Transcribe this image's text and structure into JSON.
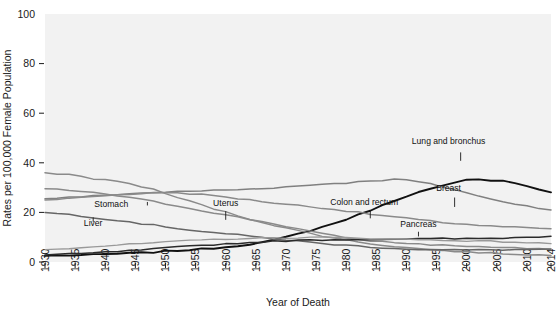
{
  "chart_data": {
    "type": "line",
    "title": "",
    "xlabel": "Year of Death",
    "ylabel": "Rates per 100,000 Female Population",
    "xlim": [
      1930,
      2014
    ],
    "ylim": [
      0,
      100
    ],
    "grid": false,
    "legend_position": "inline-annotations",
    "x_ticks": [
      "1930",
      "1935",
      "1940",
      "1945",
      "1950",
      "1955",
      "1960",
      "1965",
      "1970",
      "1975",
      "1980",
      "1985",
      "1990",
      "1995",
      "2000",
      "2005",
      "2010",
      "2014"
    ],
    "y_ticks": [
      "0",
      "20",
      "40",
      "60",
      "80",
      "100"
    ],
    "x_tick_values": [
      1930,
      1935,
      1940,
      1945,
      1950,
      1955,
      1960,
      1965,
      1970,
      1975,
      1980,
      1985,
      1990,
      1995,
      2000,
      2005,
      2010,
      2014
    ],
    "y_tick_values": [
      0,
      20,
      40,
      60,
      80,
      100
    ],
    "x_years": [
      1930,
      1932,
      1934,
      1936,
      1938,
      1940,
      1942,
      1944,
      1946,
      1948,
      1950,
      1952,
      1954,
      1956,
      1958,
      1960,
      1962,
      1964,
      1966,
      1968,
      1970,
      1972,
      1974,
      1976,
      1978,
      1980,
      1982,
      1984,
      1986,
      1988,
      1990,
      1992,
      1994,
      1996,
      1998,
      2000,
      2002,
      2004,
      2006,
      2008,
      2010,
      2012,
      2014
    ],
    "series": [
      {
        "name": "Lung and bronchus",
        "color": "#111111",
        "width": 1.9,
        "label_x": 1997,
        "label_y": 47.5,
        "leader": {
          "x": 1999,
          "y1": 44.2,
          "y2": 40.8
        },
        "values": [
          2.5,
          2.6,
          2.7,
          2.8,
          2.9,
          3.1,
          3.3,
          3.5,
          3.7,
          3.9,
          4.3,
          4.6,
          4.9,
          5.2,
          5.6,
          6.0,
          6.6,
          7.2,
          7.9,
          8.8,
          10.0,
          11.3,
          12.7,
          14.1,
          15.6,
          17.2,
          19.0,
          20.9,
          22.8,
          24.8,
          26.6,
          28.1,
          29.4,
          30.6,
          31.8,
          33.0,
          33.2,
          33.0,
          32.9,
          32.0,
          30.5,
          29.3,
          28.1
        ],
        "visual_values": [
          2.5,
          2.6,
          2.7,
          2.8,
          2.9,
          3.1,
          3.3,
          3.5,
          3.7,
          3.9,
          4.3,
          4.6,
          4.9,
          5.2,
          5.6,
          6.0,
          6.6,
          7.2,
          7.9,
          8.8,
          10.0,
          11.3,
          12.7,
          14.1,
          15.6,
          17.2,
          19.0,
          20.9,
          22.8,
          24.8,
          26.6,
          28.1,
          29.4,
          30.6,
          31.8,
          33.0,
          33.2,
          33.0,
          32.9,
          32.0,
          30.5,
          29.3,
          28.1
        ]
      },
      {
        "name": "Breast",
        "color": "#808080",
        "width": 1.5,
        "label_x": 1997,
        "label_y": 28.5,
        "leader": {
          "x": 1998,
          "y1": 26.0,
          "y2": 22.2
        },
        "values": [
          25.5,
          25.8,
          26.0,
          26.3,
          26.6,
          26.9,
          27.3,
          27.5,
          27.8,
          28.0,
          28.2,
          28.3,
          28.5,
          28.7,
          28.9,
          29.0,
          29.2,
          29.4,
          29.7,
          30.0,
          30.3,
          30.6,
          31.0,
          31.5,
          31.7,
          31.9,
          32.3,
          32.8,
          33.0,
          33.3,
          33.1,
          32.3,
          31.4,
          30.3,
          29.2,
          28.0,
          26.5,
          25.3,
          24.4,
          23.5,
          22.6,
          21.8,
          21.0
        ],
        "visual_values": [
          25.5,
          25.8,
          26.0,
          26.3,
          26.6,
          26.9,
          27.3,
          27.5,
          27.8,
          28.0,
          28.2,
          28.3,
          28.5,
          28.7,
          28.9,
          29.0,
          29.2,
          29.4,
          29.7,
          30.0,
          30.3,
          30.6,
          31.0,
          31.5,
          31.7,
          31.9,
          32.3,
          32.8,
          33.0,
          33.3,
          33.1,
          32.3,
          31.4,
          30.3,
          29.2,
          28.0,
          26.5,
          25.3,
          24.4,
          23.5,
          22.6,
          21.8,
          21.0
        ]
      },
      {
        "name": "Colon and rectum",
        "color": "#8a8a8a",
        "width": 1.5,
        "label_x": 1983,
        "label_y": 23.0,
        "leader": {
          "x": 1984,
          "y1": 21.0,
          "y2": 17.6
        },
        "values": [
          25.0,
          25.3,
          25.6,
          26.0,
          26.4,
          26.8,
          27.1,
          27.4,
          27.6,
          27.8,
          28.0,
          27.9,
          27.6,
          27.2,
          26.7,
          26.2,
          25.6,
          25.0,
          24.4,
          23.8,
          23.3,
          22.8,
          22.3,
          21.8,
          21.2,
          20.6,
          20.0,
          19.3,
          18.7,
          18.2,
          17.6,
          17.0,
          16.5,
          16.0,
          15.6,
          15.2,
          14.8,
          14.5,
          14.2,
          14.0,
          13.8,
          13.6,
          13.4
        ],
        "visual_values": [
          25.0,
          25.3,
          25.6,
          26.0,
          26.4,
          26.8,
          27.1,
          27.4,
          27.6,
          27.8,
          28.0,
          27.9,
          27.6,
          27.2,
          26.7,
          26.2,
          25.6,
          25.0,
          24.4,
          23.8,
          23.3,
          22.8,
          22.3,
          21.8,
          21.2,
          20.6,
          20.0,
          19.3,
          18.7,
          18.2,
          17.6,
          17.0,
          16.5,
          16.0,
          15.6,
          15.2,
          14.8,
          14.5,
          14.2,
          14.0,
          13.8,
          13.6,
          13.4
        ]
      },
      {
        "name": "Uterus",
        "color": "#8a8a8a",
        "width": 1.5,
        "label_x": 1960,
        "label_y": 22.5,
        "leader": {
          "x": 1960,
          "y1": 20.5,
          "y2": 17.0
        },
        "values": [
          29.5,
          29.2,
          28.9,
          28.4,
          27.9,
          27.4,
          26.7,
          26.0,
          25.2,
          24.4,
          23.5,
          22.6,
          21.7,
          20.8,
          19.9,
          19.0,
          18.1,
          17.2,
          16.3,
          15.4,
          14.4,
          13.4,
          12.4,
          11.4,
          10.6,
          9.8,
          9.1,
          8.6,
          8.2,
          7.9,
          7.6,
          7.3,
          7.0,
          6.8,
          6.6,
          6.4,
          6.2,
          6.0,
          5.8,
          5.6,
          5.4,
          5.2,
          5.0
        ],
        "visual_values": [
          29.5,
          29.2,
          28.9,
          28.4,
          27.9,
          27.4,
          26.7,
          26.0,
          25.2,
          24.4,
          23.5,
          22.6,
          21.7,
          20.8,
          19.9,
          19.0,
          18.1,
          17.2,
          16.3,
          15.4,
          14.4,
          13.4,
          12.4,
          11.4,
          10.6,
          9.8,
          9.1,
          8.6,
          8.2,
          7.9,
          7.6,
          7.3,
          7.0,
          6.8,
          6.6,
          6.4,
          6.2,
          6.0,
          5.8,
          5.6,
          5.4,
          5.2,
          5.0
        ]
      },
      {
        "name": "Stomach",
        "color": "#8a8a8a",
        "width": 1.5,
        "label_x": 1941,
        "label_y": 22.0,
        "leader": {
          "x": 1947,
          "y1": 22.8,
          "y2": 24.2
        },
        "values": [
          36.0,
          35.6,
          35.3,
          34.5,
          33.6,
          33.2,
          32.4,
          31.6,
          30.5,
          29.2,
          27.6,
          26.0,
          24.5,
          23.0,
          21.5,
          20.1,
          18.7,
          17.4,
          16.1,
          14.9,
          13.7,
          12.6,
          11.6,
          10.6,
          9.7,
          8.9,
          8.1,
          7.4,
          6.8,
          6.3,
          5.8,
          5.4,
          5.0,
          4.6,
          4.3,
          4.0,
          3.8,
          3.6,
          3.4,
          3.2,
          3.0,
          2.8,
          2.6
        ],
        "visual_values": [
          36.0,
          35.6,
          35.3,
          34.5,
          33.6,
          33.2,
          32.4,
          31.6,
          30.5,
          29.2,
          27.6,
          26.0,
          24.5,
          23.0,
          21.5,
          20.1,
          18.7,
          17.4,
          16.1,
          14.9,
          13.7,
          12.6,
          11.6,
          10.6,
          9.7,
          8.9,
          8.1,
          7.4,
          6.8,
          6.3,
          5.8,
          5.4,
          5.0,
          4.6,
          4.3,
          4.0,
          3.8,
          3.6,
          3.4,
          3.2,
          3.0,
          2.8,
          2.6
        ]
      },
      {
        "name": "Liver",
        "color": "#666666",
        "width": 1.5,
        "label_x": 1938,
        "label_y": 14.5,
        "leader": {
          "x": 1938,
          "y1": 16.2,
          "y2": 18.0
        },
        "values": [
          20.0,
          19.6,
          19.2,
          18.6,
          18.0,
          17.4,
          16.8,
          16.2,
          15.5,
          14.9,
          14.2,
          13.6,
          13.0,
          12.4,
          11.9,
          11.4,
          10.9,
          10.4,
          9.9,
          9.4,
          8.9,
          8.4,
          7.9,
          7.5,
          7.1,
          6.7,
          6.4,
          6.1,
          5.8,
          5.5,
          5.3,
          5.1,
          5.0,
          4.9,
          4.8,
          4.8,
          4.8,
          4.9,
          4.9,
          5.0,
          5.0,
          5.1,
          5.2
        ],
        "visual_values": [
          20.0,
          19.6,
          19.2,
          18.6,
          18.0,
          17.4,
          16.8,
          16.2,
          15.5,
          14.9,
          14.2,
          13.6,
          13.0,
          12.4,
          11.9,
          11.4,
          10.9,
          10.4,
          9.9,
          9.4,
          8.9,
          8.4,
          7.9,
          7.5,
          7.1,
          6.7,
          6.4,
          6.1,
          5.8,
          5.5,
          5.3,
          5.1,
          5.0,
          4.9,
          4.8,
          4.8,
          4.8,
          4.9,
          4.9,
          5.0,
          5.0,
          5.1,
          5.2
        ]
      },
      {
        "name": "Pancreas",
        "color": "#2b2b2b",
        "width": 1.5,
        "label_x": 1992,
        "label_y": 14.0,
        "leader": {
          "x": 1992,
          "y1": 12.2,
          "y2": 10.3
        },
        "values": [
          2.8,
          3.0,
          3.2,
          3.4,
          3.6,
          3.9,
          4.2,
          4.5,
          4.8,
          5.2,
          5.6,
          6.0,
          6.4,
          6.7,
          7.0,
          7.3,
          7.6,
          7.8,
          8.1,
          8.3,
          8.5,
          8.7,
          8.8,
          8.9,
          9.0,
          9.1,
          9.1,
          9.2,
          9.2,
          9.3,
          9.3,
          9.3,
          9.3,
          9.4,
          9.4,
          9.4,
          9.5,
          9.6,
          9.7,
          9.8,
          10.0,
          10.2,
          10.4
        ],
        "visual_values": [
          2.8,
          3.0,
          3.2,
          3.4,
          3.6,
          3.9,
          4.2,
          4.5,
          4.8,
          5.2,
          5.6,
          6.0,
          6.4,
          6.7,
          7.0,
          7.3,
          7.6,
          7.8,
          8.1,
          8.3,
          8.5,
          8.7,
          8.8,
          8.9,
          9.0,
          9.1,
          9.1,
          9.2,
          9.2,
          9.3,
          9.3,
          9.3,
          9.3,
          9.4,
          9.4,
          9.4,
          9.5,
          9.6,
          9.7,
          9.8,
          10.0,
          10.2,
          10.4
        ]
      },
      {
        "name": "Ovary",
        "color": "#999999",
        "width": 1.4,
        "label_x": null,
        "label_y": null,
        "leader": null,
        "values": [
          5.0,
          5.3,
          5.6,
          5.9,
          6.2,
          6.5,
          6.8,
          7.1,
          7.4,
          7.7,
          8.0,
          8.3,
          8.6,
          8.9,
          9.1,
          9.3,
          9.4,
          9.5,
          9.6,
          9.7,
          9.8,
          9.8,
          9.9,
          9.9,
          9.8,
          9.7,
          9.6,
          9.5,
          9.4,
          9.3,
          9.2,
          9.0,
          8.9,
          8.8,
          8.7,
          8.6,
          8.4,
          8.3,
          8.2,
          8.0,
          7.8,
          7.6,
          7.4
        ],
        "visual_values": [
          5.0,
          5.3,
          5.6,
          5.9,
          6.2,
          6.5,
          6.8,
          7.1,
          7.4,
          7.7,
          8.0,
          8.3,
          8.6,
          8.9,
          9.1,
          9.3,
          9.4,
          9.5,
          9.6,
          9.7,
          9.8,
          9.8,
          9.9,
          9.9,
          9.8,
          9.7,
          9.6,
          9.5,
          9.4,
          9.3,
          9.2,
          9.0,
          8.9,
          8.8,
          8.7,
          8.6,
          8.4,
          8.3,
          8.2,
          8.0,
          7.8,
          7.6,
          7.4
        ]
      }
    ]
  },
  "plot": {
    "background_color": "#f2f2f2",
    "left": 45,
    "top": 14,
    "right": 551,
    "bottom": 262
  }
}
